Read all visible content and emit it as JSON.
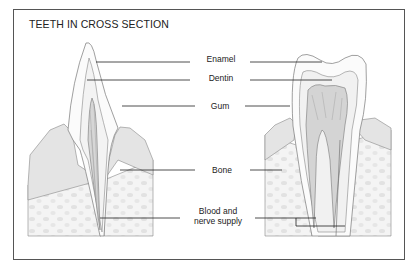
{
  "title": "TEETH IN CROSS SECTION",
  "labels": {
    "enamel": "Enamel",
    "dentin": "Dentin",
    "gum": "Gum",
    "bone": "Bone",
    "blood_line1": "Blood and",
    "blood_line2": "nerve supply"
  },
  "teeth": [
    "incisor (left, single root)",
    "molar (right, two roots)"
  ],
  "colors": {
    "line": "#333333",
    "bone_fill": "#f1f1f1",
    "gum_fill": "#e2e2e2",
    "pulp_fill": "#d8d8d8"
  }
}
